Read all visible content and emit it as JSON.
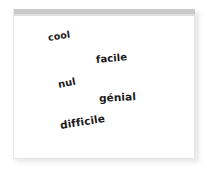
{
  "card": {
    "background_color": "#ffffff",
    "border_color": "#e6e6e6",
    "titlebar_color": "#c9c9c9"
  },
  "wordcloud": {
    "title": "",
    "text_color": "#1a1a1a",
    "words": [
      {
        "text": "cool",
        "rotation_deg": -9,
        "font_size_px": 9.5
      },
      {
        "text": "facile",
        "rotation_deg": -5,
        "font_size_px": 10
      },
      {
        "text": "nul",
        "rotation_deg": -11,
        "font_size_px": 10
      },
      {
        "text": "génial",
        "rotation_deg": -3,
        "font_size_px": 10.5
      },
      {
        "text": "difficile",
        "rotation_deg": -9,
        "font_size_px": 10.5
      }
    ]
  }
}
